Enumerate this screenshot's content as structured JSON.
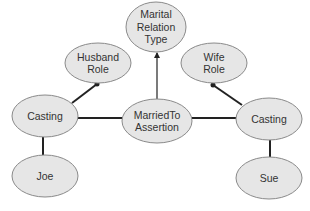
{
  "diagram": {
    "colors": {
      "node_fill": "#e6e6e6",
      "node_stroke": "#8a8a8a",
      "edge": "#222222",
      "text": "#333333",
      "background": "#ffffff"
    },
    "nodes": [
      {
        "id": "marital-relation-type",
        "lines": [
          "Marital",
          "Relation",
          "Type"
        ],
        "cx": 156,
        "cy": 27,
        "rx": 30,
        "ry": 25
      },
      {
        "id": "husband-role",
        "lines": [
          "Husband",
          "Role"
        ],
        "cx": 98,
        "cy": 63,
        "rx": 33,
        "ry": 20
      },
      {
        "id": "wife-role",
        "lines": [
          "Wife",
          "Role"
        ],
        "cx": 214,
        "cy": 63,
        "rx": 33,
        "ry": 20
      },
      {
        "id": "casting-left",
        "lines": [
          "Casting"
        ],
        "cx": 45,
        "cy": 116,
        "rx": 33,
        "ry": 21
      },
      {
        "id": "married-to-assertion",
        "lines": [
          "MarriedTo",
          "Assertion"
        ],
        "cx": 157,
        "cy": 121,
        "rx": 35,
        "ry": 22
      },
      {
        "id": "casting-right",
        "lines": [
          "Casting"
        ],
        "cx": 269,
        "cy": 119,
        "rx": 33,
        "ry": 21
      },
      {
        "id": "joe",
        "lines": [
          "Joe"
        ],
        "cx": 45,
        "cy": 176,
        "rx": 33,
        "ry": 21
      },
      {
        "id": "sue",
        "lines": [
          "Sue"
        ],
        "cx": 269,
        "cy": 178,
        "rx": 33,
        "ry": 21
      }
    ],
    "edges": [
      {
        "from": "married-to-assertion",
        "to": "marital-relation-type",
        "x1": 157,
        "y1": 99,
        "x2": 157,
        "y2": 53,
        "end": "arrow"
      },
      {
        "from": "casting-left",
        "to": "husband-role",
        "x1": 72,
        "y1": 103,
        "x2": 97,
        "y2": 84,
        "end": "dot"
      },
      {
        "from": "casting-right",
        "to": "wife-role",
        "x1": 242,
        "y1": 105,
        "x2": 213,
        "y2": 85,
        "end": "dot"
      },
      {
        "from": "casting-left",
        "to": "married-to-assertion",
        "x1": 78,
        "y1": 118,
        "x2": 122,
        "y2": 118,
        "end": "none"
      },
      {
        "from": "married-to-assertion",
        "to": "casting-right",
        "x1": 192,
        "y1": 118,
        "x2": 236,
        "y2": 118,
        "end": "none"
      },
      {
        "from": "casting-left",
        "to": "joe",
        "x1": 43,
        "y1": 137,
        "x2": 43,
        "y2": 155,
        "end": "none"
      },
      {
        "from": "casting-right",
        "to": "sue",
        "x1": 270,
        "y1": 140,
        "x2": 270,
        "y2": 157,
        "end": "none"
      }
    ]
  }
}
